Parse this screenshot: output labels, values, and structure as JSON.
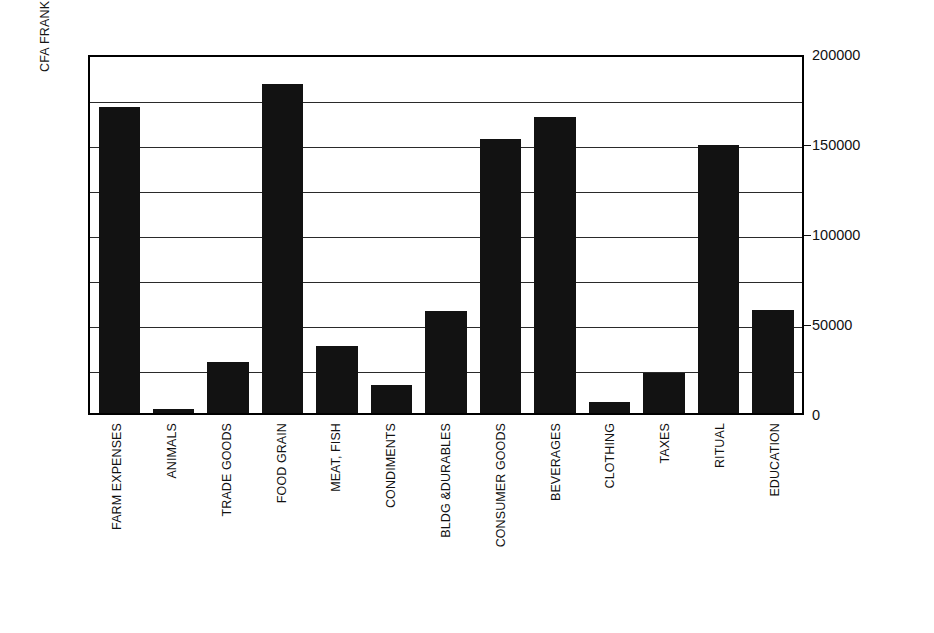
{
  "chart_data": {
    "type": "bar",
    "title": "",
    "xlabel": "",
    "ylabel": "CFA FRANKS",
    "ylim": [
      0,
      200000
    ],
    "ytick_labels": [
      "0",
      "50000",
      "100000",
      "150000",
      "200000"
    ],
    "ytick_values": [
      0,
      50000,
      100000,
      150000,
      200000
    ],
    "gridline_values": [
      25000,
      50000,
      75000,
      100000,
      125000,
      150000,
      175000
    ],
    "grid": true,
    "legend": "none",
    "bar_color": "#121212",
    "categories": [
      "FARM EXPENSES",
      "ANIMALS",
      "TRADE GOODS",
      "FOOD GRAIN",
      "MEAT, FISH",
      "CONDIMENTS",
      "BLDG &DURABLES",
      "CONSUMER GOODS",
      "BEVERAGES",
      "CLOTHING",
      "TAXES",
      "RITUAL",
      "EDUCATION"
    ],
    "values": [
      170000,
      2500,
      28500,
      183000,
      37000,
      15500,
      56500,
      152000,
      164500,
      6000,
      22000,
      149000,
      57500
    ]
  }
}
